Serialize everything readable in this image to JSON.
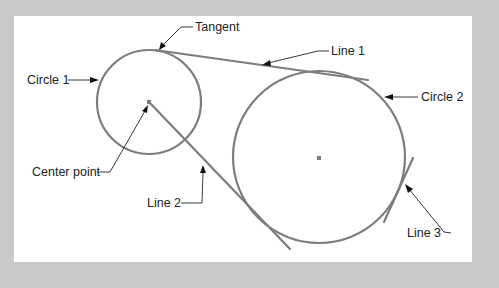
{
  "diagram": {
    "type": "geometry-annotation",
    "labels": {
      "tangent": "Tangent",
      "line1": "Line 1",
      "circle1": "Circle 1",
      "circle2": "Circle 2",
      "center_point": "Center point",
      "line2": "Line 2",
      "line3": "Line 3"
    },
    "elements": [
      {
        "id": "circle1",
        "kind": "circle"
      },
      {
        "id": "circle2",
        "kind": "circle"
      },
      {
        "id": "line1",
        "kind": "line",
        "relation": "tangent to circle 1 and circle 2"
      },
      {
        "id": "line2",
        "kind": "line",
        "relation": "from center of circle 1, tangent to circle 2"
      },
      {
        "id": "line3",
        "kind": "line",
        "relation": "tangent to circle 2"
      },
      {
        "id": "center_point",
        "kind": "point",
        "relation": "center of circle 1"
      }
    ],
    "colors": {
      "background": "#c9c9c9",
      "panel": "#ffffff",
      "geometry_stroke": "#7d7d7d",
      "leader": "#222222"
    }
  }
}
